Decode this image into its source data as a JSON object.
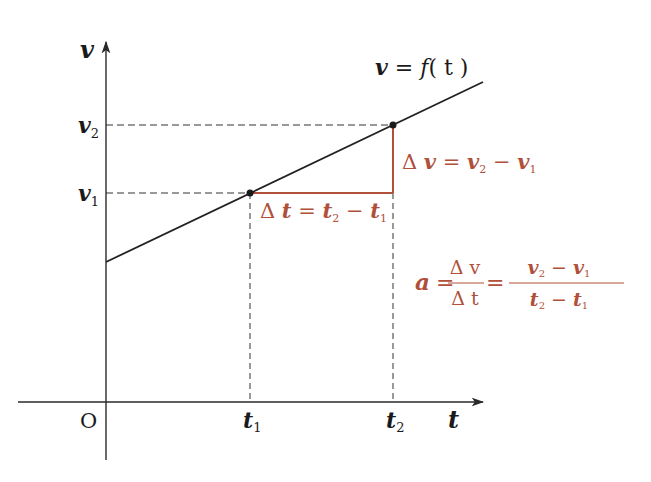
{
  "diagram": {
    "axes": {
      "x_label": "t",
      "y_label": "v",
      "origin_label": "O",
      "x_ticks": [
        "t1",
        "t2"
      ],
      "y_ticks": [
        "v1",
        "v2"
      ]
    },
    "curve_label": {
      "lhs": "v",
      "eq": " = ",
      "fn": "f",
      "arg": "( t )"
    },
    "delta_v": {
      "delta": "Δ",
      "v": "v",
      "eq": " = ",
      "a": "v",
      "a_sub": "2",
      "minus": " − ",
      "b": "v",
      "b_sub": "1"
    },
    "delta_t": {
      "delta": "Δ",
      "t": "t",
      "eq": " = ",
      "a": "t",
      "a_sub": "2",
      "minus": " − ",
      "b": "t",
      "b_sub": "1"
    },
    "formula": {
      "lhs": "a",
      "eq1": "=",
      "frac1_num": "Δ v",
      "frac1_den": "Δ t",
      "eq2": "=",
      "frac2_num_a": "v",
      "frac2_num_a_sub": "2",
      "frac2_num_minus": " − ",
      "frac2_num_b": "v",
      "frac2_num_b_sub": "1",
      "frac2_den_a": "t",
      "frac2_den_a_sub": "2",
      "frac2_den_minus": " − ",
      "frac2_den_b": "t",
      "frac2_den_b_sub": "1"
    },
    "colors": {
      "axis": "#2a2a2a",
      "line": "#222222",
      "accent": "#b0503a",
      "dash": "#333333"
    }
  }
}
